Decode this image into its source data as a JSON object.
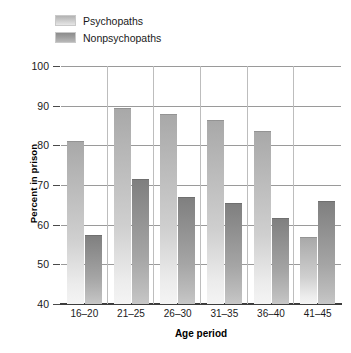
{
  "chart_data": {
    "type": "bar",
    "title": "",
    "xlabel": "Age period",
    "ylabel": "Percent in prison",
    "categories": [
      "16–20",
      "21–25",
      "26–30",
      "31–35",
      "36–40",
      "41–45"
    ],
    "series": [
      {
        "name": "Psychopaths",
        "color": "#c9c9c9",
        "values": [
          81,
          89.3,
          88,
          86.5,
          83.5,
          57
        ]
      },
      {
        "name": "Nonpsychopaths",
        "color": "#9a9a9a",
        "values": [
          57.5,
          71.5,
          67,
          65.5,
          61.8,
          66
        ]
      }
    ],
    "ylim": [
      40,
      100
    ],
    "yticks": [
      40,
      50,
      60,
      70,
      80,
      90,
      100
    ],
    "ytick_labels": [
      "40",
      "50",
      "60",
      "70",
      "80",
      "90",
      "100"
    ],
    "grid": true,
    "legend_position": "top-left"
  },
  "legend": {
    "items": [
      {
        "label": "Psychopaths",
        "swatch": "psy"
      },
      {
        "label": "Nonpsychopaths",
        "swatch": "nonpsy"
      }
    ]
  }
}
